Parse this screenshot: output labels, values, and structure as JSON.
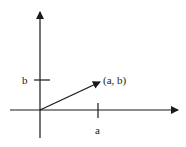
{
  "diagram": {
    "type": "vector-in-plane",
    "labels": {
      "point": "(a, b)",
      "x_tick": "a",
      "y_tick": "b"
    },
    "colors": {
      "stroke": "#1a1a1a",
      "background": "#ffffff"
    }
  }
}
